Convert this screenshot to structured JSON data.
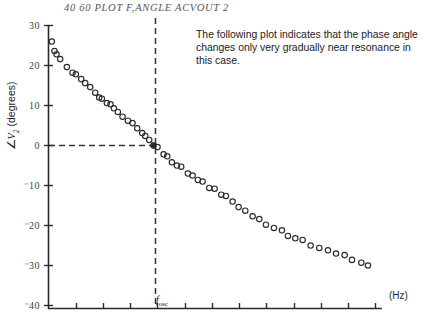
{
  "header": {
    "command_line": "40 60 PLOT F,ANGLE ACVOUT 2"
  },
  "annotation": {
    "text": "The following plot indicates that the phase angle changes only very gradually near resonance in this case."
  },
  "labels": {
    "y_axis_title_prefix": "∠",
    "y_axis_title_var": "V",
    "y_axis_title_sub": "2",
    "y_axis_title_unit": " (degrees)",
    "x_axis_unit": "(Hz)",
    "fosc_symbol": "f",
    "fosc_sub": "osc"
  },
  "chart_data": {
    "type": "scatter",
    "title": "",
    "xlabel": "(Hz)",
    "ylabel": "∠V2 (degrees)",
    "grid": false,
    "legend": null,
    "ylim": [
      -40,
      30
    ],
    "yticks": [
      30,
      20,
      10,
      0,
      -10,
      -20,
      -30,
      -40
    ],
    "ytick_labels": [
      "30",
      "20",
      "10",
      "0",
      "⁻10",
      "⁻20",
      "⁻30",
      "⁻40"
    ],
    "xlim": [
      0,
      1
    ],
    "xtick_count": 12,
    "xtick_labels": [],
    "marker": "open-circle",
    "marker_color": "#2b2b2b",
    "annotations": [
      {
        "name": "fosc-vertical-dashed",
        "x": 0.315,
        "label": "f_osc",
        "style": "dashed"
      },
      {
        "name": "zero-horizontal-dashed",
        "y": 0,
        "style": "dashed"
      },
      {
        "name": "resonance-point",
        "x": 0.315,
        "y": 0,
        "style": "filled-circle"
      }
    ],
    "x": [
      0.01,
      0.018,
      0.024,
      0.035,
      0.055,
      0.072,
      0.082,
      0.098,
      0.11,
      0.125,
      0.14,
      0.152,
      0.16,
      0.175,
      0.186,
      0.196,
      0.208,
      0.222,
      0.238,
      0.252,
      0.266,
      0.281,
      0.29,
      0.302,
      0.315,
      0.327,
      0.345,
      0.356,
      0.37,
      0.385,
      0.398,
      0.418,
      0.432,
      0.448,
      0.462,
      0.482,
      0.498,
      0.518,
      0.532,
      0.552,
      0.57,
      0.59,
      0.612,
      0.632,
      0.652,
      0.676,
      0.7,
      0.718,
      0.74,
      0.762,
      0.786,
      0.812,
      0.838,
      0.862,
      0.888,
      0.91,
      0.938,
      0.958
    ],
    "y": [
      26.0,
      23.6,
      22.8,
      21.6,
      19.6,
      18.2,
      17.8,
      16.6,
      15.6,
      14.6,
      13.2,
      12.0,
      11.7,
      10.6,
      10.3,
      9.3,
      8.4,
      7.2,
      6.2,
      5.6,
      4.3,
      3.1,
      2.4,
      1.4,
      0.0,
      -0.4,
      -2.2,
      -2.7,
      -4.2,
      -5.0,
      -5.3,
      -7.0,
      -7.5,
      -8.6,
      -9.0,
      -10.6,
      -10.8,
      -12.3,
      -12.6,
      -14.0,
      -15.4,
      -16.3,
      -17.7,
      -18.4,
      -19.8,
      -20.6,
      -21.2,
      -22.6,
      -23.2,
      -23.6,
      -25.0,
      -25.6,
      -26.2,
      -27.0,
      -27.4,
      -28.6,
      -29.3,
      -30.0
    ]
  },
  "colors": {
    "axis": "#2a2a2a",
    "marker": "#2b2b2b",
    "dashed": "#333333",
    "text": "#1b1b1b",
    "header_text": "#55565a",
    "background": "#ffffff"
  }
}
